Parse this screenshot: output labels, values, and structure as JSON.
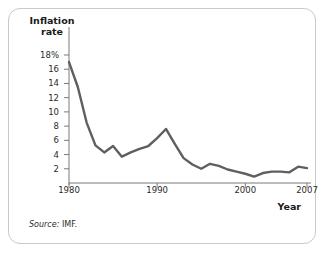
{
  "figure": {
    "y_axis_title_line1": "Inflation",
    "y_axis_title_line2": "rate",
    "x_axis_title": "Year",
    "source_label": "Source:",
    "source_value": "IMF.",
    "line_color": "#5f5f5f",
    "axis_color": "#7a7a7a",
    "border_color": "#c9c9c9"
  },
  "chart_data": {
    "type": "line",
    "title": "",
    "xlabel": "Year",
    "ylabel": "Inflation rate",
    "xlim": [
      1980,
      2007
    ],
    "ylim": [
      0,
      19
    ],
    "grid": false,
    "legend": "none",
    "y_tick_labels": [
      "2",
      "4",
      "6",
      "8",
      "10",
      "12",
      "14",
      "16",
      "18%"
    ],
    "y_ticks": [
      2,
      4,
      6,
      8,
      10,
      12,
      14,
      16,
      18
    ],
    "x_tick_labels": [
      "1980",
      "1990",
      "2000",
      "2007"
    ],
    "x_ticks": [
      1980,
      1990,
      2000,
      2007
    ],
    "series": [
      {
        "name": "Inflation rate",
        "x": [
          1980,
          1981,
          1982,
          1983,
          1984,
          1985,
          1986,
          1987,
          1988,
          1989,
          1990,
          1991,
          1992,
          1993,
          1994,
          1995,
          1996,
          1997,
          1998,
          1999,
          2000,
          2001,
          2002,
          2003,
          2004,
          2005,
          2006,
          2007
        ],
        "values": [
          17.0,
          13.5,
          8.5,
          5.3,
          4.3,
          5.2,
          3.7,
          4.3,
          4.8,
          5.2,
          6.3,
          7.6,
          5.5,
          3.5,
          2.6,
          2.0,
          2.7,
          2.4,
          1.9,
          1.6,
          1.3,
          0.9,
          1.4,
          1.6,
          1.6,
          1.5,
          2.3,
          2.1
        ]
      }
    ]
  }
}
